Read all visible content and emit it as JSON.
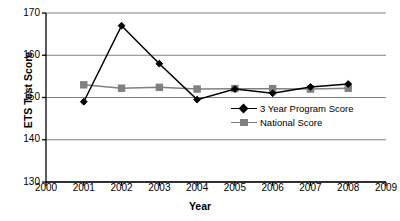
{
  "chart_data": {
    "type": "line",
    "title": "",
    "xlabel": "Year",
    "ylabel": "ETS Test Score",
    "xlim": [
      2000,
      2009
    ],
    "ylim": [
      130,
      170
    ],
    "ytick_labels": [
      "170",
      "160",
      "150",
      "140",
      "130"
    ],
    "ytick_values": [
      170,
      160,
      150,
      140,
      130
    ],
    "xtick_labels": [
      "2000",
      "2001",
      "2002",
      "2003",
      "2004",
      "2005",
      "2006",
      "2007",
      "2008",
      "2009"
    ],
    "xtick_values": [
      2000,
      2001,
      2002,
      2003,
      2004,
      2005,
      2006,
      2007,
      2008,
      2009
    ],
    "grid": true,
    "grid_axis": "y",
    "legend_position": "inside-right",
    "x": [
      2001,
      2002,
      2003,
      2004,
      2005,
      2006,
      2007,
      2008
    ],
    "series": [
      {
        "name": "3 Year Program Score",
        "marker": "diamond",
        "color": "#000000",
        "values": [
          149.0,
          167.0,
          158.0,
          149.5,
          152.0,
          151.0,
          152.5,
          153.2
        ]
      },
      {
        "name": "National Score",
        "marker": "square",
        "color": "#808080",
        "values": [
          153.0,
          152.2,
          152.4,
          152.0,
          152.1,
          152.1,
          152.0,
          152.2
        ]
      }
    ]
  },
  "legend": {
    "entries": [
      {
        "label": "3 Year Program Score",
        "marker": "diamond-marker",
        "color": "#000000"
      },
      {
        "label": "National Score",
        "marker": "square-marker",
        "color": "#808080"
      }
    ]
  },
  "axes": {
    "y_title": "ETS Test Score",
    "x_title": "Year"
  },
  "colors": {
    "program_series": "#000000",
    "national_series": "#808080",
    "gridline": "#808080",
    "axis": "#000000",
    "background": "#ffffff"
  }
}
